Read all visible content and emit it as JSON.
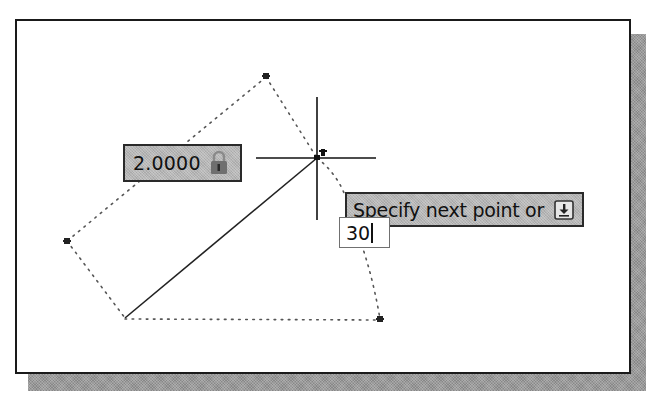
{
  "drawing": {
    "origin_point": {
      "x": 125,
      "y": 318
    },
    "cursor_point": {
      "x": 317,
      "y": 158
    },
    "vertices": [
      {
        "name": "top",
        "x": 266,
        "y": 76
      },
      {
        "name": "left",
        "x": 67,
        "y": 241
      },
      {
        "name": "bottom-right",
        "x": 380,
        "y": 319
      }
    ]
  },
  "dimension_input": {
    "value": "2.0000",
    "icon": "lock-icon"
  },
  "command_prompt": {
    "label": "Specify next point or",
    "options_icon": "down-arrow-options-icon"
  },
  "angle_input": {
    "value": "30"
  },
  "colors": {
    "tooltip_bg": "#b5b5b5",
    "tooltip_border": "#2a2a2a",
    "frame_border": "#1a1a1a",
    "shadow": "#9a9a9a",
    "line": "#222222"
  }
}
